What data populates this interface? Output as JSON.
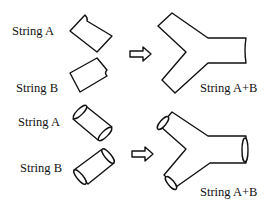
{
  "diagram": {
    "top_row": {
      "label_a": "String A",
      "label_b": "String B",
      "label_result": "String A+B",
      "style": "flat segments"
    },
    "bottom_row": {
      "label_a": "String A",
      "label_b": "String B",
      "label_result": "String A+B",
      "style": "tubular segments"
    },
    "arrow": "hollow right arrow"
  }
}
